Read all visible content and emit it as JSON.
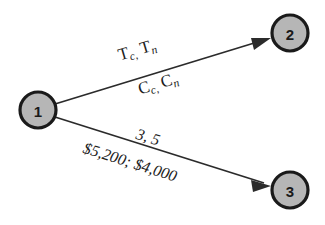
{
  "diagram": {
    "type": "directed-network-graph",
    "background_color": "#ffffff",
    "node_fill_color": "#b6b6b6",
    "node_stroke_color": "#1a1a1a",
    "edge_color": "#2b2b2b",
    "nodes": [
      {
        "id": "1",
        "label": "1",
        "cx": 38,
        "cy": 110,
        "r": 18
      },
      {
        "id": "2",
        "label": "2",
        "cx": 290,
        "cy": 33,
        "r": 18
      },
      {
        "id": "3",
        "label": "3",
        "cx": 290,
        "cy": 190,
        "r": 18
      }
    ],
    "edges": [
      {
        "id": "edge-1-2",
        "from": "1",
        "to": "2",
        "label_above_symbolic": "T",
        "label_above_sub_1": "c,",
        "label_above_sym_2": "T",
        "label_above_sub_2": "n",
        "label_below_symbolic": "C",
        "label_below_sub_1": "c,",
        "label_below_sym_2": "C",
        "label_below_sub_2": "n"
      },
      {
        "id": "edge-1-3",
        "from": "1",
        "to": "3",
        "label_above": "3, 5",
        "label_below": "$5,200; $4,000"
      }
    ]
  }
}
